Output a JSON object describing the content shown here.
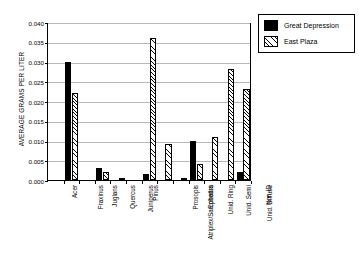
{
  "chart_data": {
    "type": "bar",
    "title": "",
    "subtitle": "",
    "xlabel": "",
    "ylabel": "AVERAGE GRAMS PER LITER",
    "ylim": [
      0.0,
      0.04
    ],
    "ytick_labels": [
      "0.040",
      "0.035",
      "0.030",
      "0.025",
      "0.020",
      "0.015",
      "0.010",
      "0.005",
      "0.000"
    ],
    "ytick_values": [
      0.04,
      0.035,
      0.03,
      0.025,
      0.02,
      0.015,
      0.01,
      0.005,
      0.0
    ],
    "grid": "horizontal",
    "legend_position": "top-right",
    "categories": [
      "Acer",
      "Fraxinus",
      "Juglans",
      "Quercus",
      "Juniperus",
      "Pinus",
      "Atriplex/Sarcobatus",
      "Prosopis",
      "Ephedra",
      "Unid. Ring",
      "Unid. Semi",
      "Unid. Diffuse",
      "Non-ID"
    ],
    "series": [
      {
        "name": "Great Depression",
        "fill": "solid-black",
        "color": "#000000",
        "values": [
          0.0,
          0.03,
          0.0,
          0.003,
          0.0,
          0.0,
          0.0015,
          0.0,
          0.0,
          0.01,
          0.0,
          0.0,
          0.002
        ]
      },
      {
        "name": "East Plaza",
        "fill": "diagonal-hatch",
        "color": "#000000",
        "values": [
          0.0,
          0.022,
          0.0,
          0.002,
          0.0004,
          0.0,
          0.036,
          0.009,
          0.0005,
          0.004,
          0.011,
          0.028,
          0.023
        ]
      }
    ]
  },
  "legend": {
    "items": [
      {
        "label": "Great Depression"
      },
      {
        "label": "East Plaza"
      }
    ]
  }
}
